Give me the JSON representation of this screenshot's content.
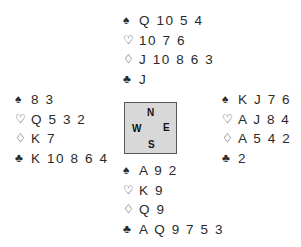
{
  "suits": {
    "spades": "♠",
    "hearts": "♡",
    "diamonds": "♢",
    "clubs": "♣"
  },
  "hands": {
    "north": {
      "spades": "Q 10 5 4",
      "hearts": "10 7 6",
      "diamonds": "J 10 8 6 3",
      "clubs": "J"
    },
    "west": {
      "spades": "8 3",
      "hearts": "Q 5 3 2",
      "diamonds": "K 7",
      "clubs": "K 10 8 6 4"
    },
    "east": {
      "spades": "K J 7 6",
      "hearts": "A J 8 4",
      "diamonds": "A 5 4 2",
      "clubs": "2"
    },
    "south": {
      "spades": "A 9 2",
      "hearts": "K 9",
      "diamonds": "Q 9",
      "clubs": "A Q 9 7 5 3"
    }
  },
  "compass": {
    "n": "N",
    "s": "S",
    "w": "W",
    "e": "E"
  }
}
